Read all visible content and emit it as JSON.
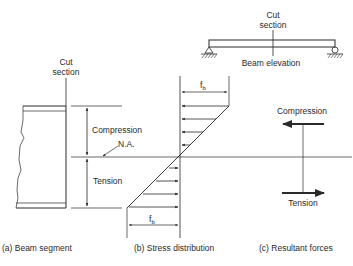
{
  "beam_elevation": {
    "cut_label_line1": "Cut",
    "cut_label_line2": "section",
    "caption": "Beam elevation"
  },
  "panel_a": {
    "cut_label_line1": "Cut",
    "cut_label_line2": "section",
    "compression_label": "Compression",
    "na_label": "N.A.",
    "tension_label": "Tension",
    "caption": "(a)  Beam segment"
  },
  "panel_b": {
    "top_stress_label": "f",
    "top_stress_sub": "b",
    "bottom_stress_label": "f",
    "bottom_stress_sub": "b",
    "caption": "(b)  Stress distribution"
  },
  "panel_c": {
    "compression_label": "Compression",
    "tension_label": "Tension",
    "caption": "(c)  Resultant forces"
  },
  "colors": {
    "line": "#2a2a2a",
    "background": "#ffffff"
  }
}
